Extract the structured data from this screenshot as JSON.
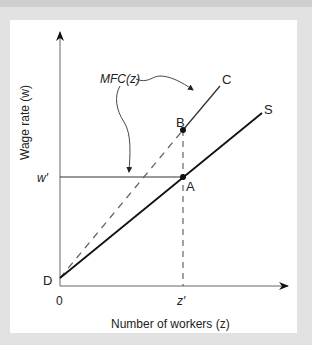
{
  "figure": {
    "background_color": "#e2e2e2",
    "panel_color": "#ffffff",
    "line_color": "#222222",
    "axis_color": "#555555"
  },
  "axes": {
    "y_label": "Wage rate (w)",
    "x_label": "Number of workers (z)",
    "origin_label": "0",
    "x_tick_label": "z′",
    "y_tick_label": "w′"
  },
  "curves": {
    "supply": {
      "label": "S",
      "style": "solid"
    },
    "mfc": {
      "label": "C",
      "style": "dashed-then-solid"
    }
  },
  "points": {
    "intercept": "D",
    "equilibrium": "A",
    "mfc_point": "B"
  },
  "annotations": {
    "mfc_label": "MFC(z)"
  }
}
